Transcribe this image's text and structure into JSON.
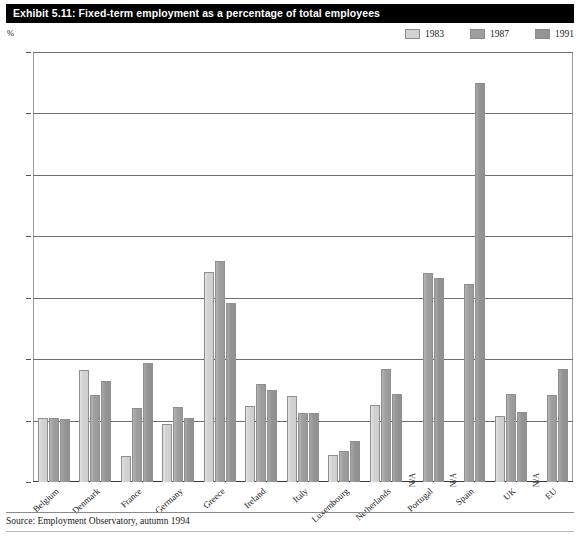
{
  "exhibit": {
    "title": "Exhibit 5.11: Fixed-term employment as a percentage of total employees",
    "unit_label": "%",
    "source": "Source: Employment Observatory, autumn 1994"
  },
  "legend": {
    "items": [
      {
        "label": "1983",
        "color": "#d2d2d2"
      },
      {
        "label": "1987",
        "color": "#9e9e9e"
      },
      {
        "label": "1991",
        "color": "#949494"
      }
    ]
  },
  "yaxis": {
    "ticks": [
      "0",
      "5",
      "10",
      "15",
      "20",
      "25",
      "30",
      "35"
    ]
  },
  "chart_data": {
    "type": "bar",
    "title": "Exhibit 5.11: Fixed-term employment as a percentage of total employees",
    "subtitle": "",
    "xlabel": "",
    "ylabel": "%",
    "ylim": [
      0,
      35
    ],
    "yticks": [
      0,
      5,
      10,
      15,
      20,
      25,
      30,
      35
    ],
    "grid": true,
    "legend_position": "top-right",
    "source": "Source: Employment Observatory, autumn 1994",
    "na_label": "N/A",
    "categories": [
      "Belgium",
      "Denmark",
      "France",
      "Germany",
      "Greece",
      "Ireland",
      "Italy",
      "Luxembourg",
      "Netherlands",
      "Portugal",
      "Spain",
      "UK",
      "EU"
    ],
    "series": [
      {
        "name": "1983",
        "color": "#d2d2d2",
        "values": [
          5.2,
          9.1,
          2.1,
          4.7,
          17.1,
          6.2,
          7.0,
          2.2,
          6.3,
          null,
          null,
          5.4,
          null
        ]
      },
      {
        "name": "1987",
        "color": "#9e9e9e",
        "values": [
          5.2,
          7.1,
          6.0,
          6.1,
          18.0,
          8.0,
          5.6,
          2.5,
          9.2,
          17.0,
          16.1,
          7.2,
          7.1
        ]
      },
      {
        "name": "1991",
        "color": "#949494",
        "values": [
          5.1,
          8.2,
          9.7,
          5.2,
          14.6,
          7.5,
          5.6,
          3.3,
          7.2,
          16.6,
          32.5,
          5.7,
          9.2
        ]
      }
    ]
  }
}
